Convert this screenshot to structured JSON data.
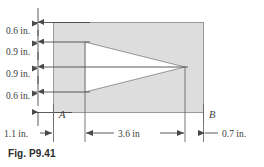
{
  "figure": {
    "caption": "Fig. P9.41",
    "shape": {
      "body_fill": "#dddddd",
      "body_stroke": "#8f8f8f",
      "notch_fill": "#ffffff",
      "line_color": "#555555"
    },
    "vertical_dimensions": [
      {
        "id": "v1",
        "label": "0.6 in."
      },
      {
        "id": "v2",
        "label": "0.9 in."
      },
      {
        "id": "v3",
        "label": "0.9 in."
      },
      {
        "id": "v4",
        "label": "0.6 in."
      }
    ],
    "horizontal_dimensions": [
      {
        "id": "h1",
        "label": "1.1 in."
      },
      {
        "id": "h2",
        "label": "3.6 in"
      },
      {
        "id": "h3",
        "label": "0.7 in."
      }
    ],
    "point_labels": [
      {
        "id": "A",
        "label": "A"
      },
      {
        "id": "B",
        "label": "B"
      }
    ]
  }
}
